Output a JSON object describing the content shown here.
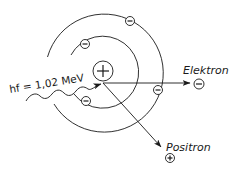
{
  "diagram": {
    "photon": {
      "label": "hf = 1,02 MeV",
      "symbol": "wavy-arrow"
    },
    "nucleus": {
      "charge": "+",
      "center": [
        103,
        72
      ],
      "radius": 10
    },
    "shells": [
      {
        "name": "inner-shell",
        "radius": 36,
        "electrons": 2
      },
      {
        "name": "outer-shell",
        "radius": 59,
        "electrons": 2
      }
    ],
    "products": [
      {
        "name": "electron",
        "label": "Elektron",
        "charge": "−"
      },
      {
        "name": "positron",
        "label": "Positron",
        "charge": "+"
      }
    ],
    "colors": {
      "line": "#1a1a1a",
      "background": "#ffffff"
    }
  }
}
